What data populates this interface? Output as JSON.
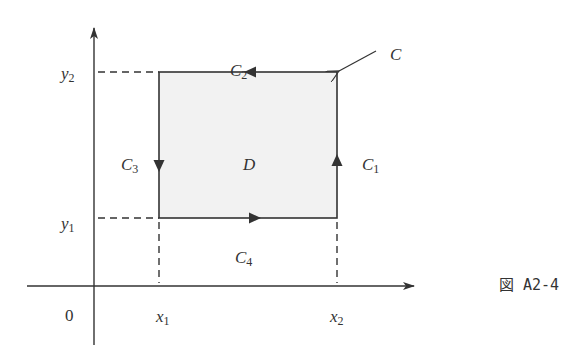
{
  "figure": {
    "caption": "図 A2-4",
    "colors": {
      "stroke": "#333333",
      "region_fill": "#f2f2f2",
      "background": "#ffffff"
    },
    "axes": {
      "origin_label": "0",
      "x_ticks": [
        {
          "base": "x",
          "sub": "1"
        },
        {
          "base": "x",
          "sub": "2"
        }
      ],
      "y_ticks": [
        {
          "base": "y",
          "sub": "1"
        },
        {
          "base": "y",
          "sub": "2"
        }
      ]
    },
    "region": {
      "label": "D"
    },
    "boundary": {
      "label": "C",
      "segments": [
        {
          "base": "C",
          "sub": "1",
          "side": "right",
          "direction": "up"
        },
        {
          "base": "C",
          "sub": "2",
          "side": "top",
          "direction": "left"
        },
        {
          "base": "C",
          "sub": "3",
          "side": "left",
          "direction": "down"
        },
        {
          "base": "C",
          "sub": "4",
          "side": "bottom",
          "direction": "right"
        }
      ]
    }
  }
}
